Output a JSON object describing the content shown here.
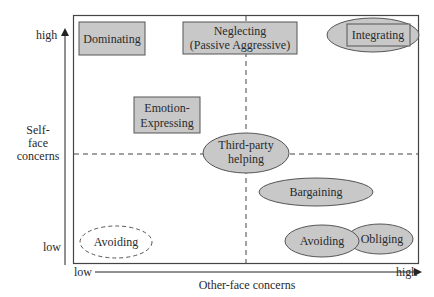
{
  "diagram": {
    "y_axis": {
      "title_lines": [
        "Self-",
        "face",
        "concerns"
      ],
      "high": "high",
      "low": "low"
    },
    "x_axis": {
      "title": "Other-face concerns",
      "low": "low",
      "high": "high"
    },
    "colors": {
      "fill": "#c8c8c8",
      "stroke": "#555555",
      "line": "#444444",
      "background": "#ffffff"
    },
    "nodes": {
      "dominating": {
        "shape": "box",
        "lines": [
          "Dominating"
        ]
      },
      "neglecting": {
        "shape": "box",
        "lines": [
          "Neglecting",
          "(Passive Aggressive)"
        ]
      },
      "integrating": {
        "shape": "box-over-ellipse",
        "lines": [
          "Integrating"
        ]
      },
      "emotion_expressing": {
        "shape": "box",
        "lines": [
          "Emotion-",
          "Expressing"
        ]
      },
      "third_party": {
        "shape": "ellipse",
        "lines": [
          "Third-party",
          "helping"
        ]
      },
      "bargaining": {
        "shape": "ellipse",
        "lines": [
          "Bargaining"
        ]
      },
      "avoiding_low": {
        "shape": "dashed-ellipse",
        "lines": [
          "Avoiding"
        ]
      },
      "avoiding_high": {
        "shape": "ellipse",
        "lines": [
          "Avoiding"
        ]
      },
      "obliging": {
        "shape": "ellipse",
        "lines": [
          "Obliging"
        ]
      }
    }
  }
}
